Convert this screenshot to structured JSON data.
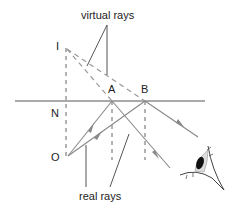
{
  "diagram": {
    "labels": {
      "virtual_rays": "virtual rays",
      "real_rays": "real rays",
      "image_point": "I",
      "object_point": "O",
      "normal_point": "N",
      "point_a": "A",
      "point_b": "B"
    },
    "colors": {
      "line": "#555555",
      "ray": "#888888",
      "dashed": "#666666",
      "text": "#222222"
    },
    "elements": [
      "mirror line",
      "normal dashed line I-N-O",
      "virtual rays dashed from I to A and B",
      "real incident rays from O to A and B",
      "reflected rays from A and B toward eye",
      "dashed normals at A and B",
      "eye"
    ]
  }
}
